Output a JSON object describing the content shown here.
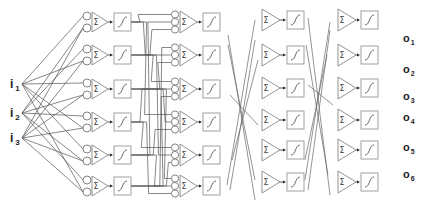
{
  "diagram": {
    "type": "feedforward-neural-network",
    "inputs": [
      {
        "label": "i",
        "sub": "1",
        "x": 10,
        "y": 88
      },
      {
        "label": "i",
        "sub": "2",
        "x": 10,
        "y": 117
      },
      {
        "label": "i",
        "sub": "3",
        "x": 10,
        "y": 142
      }
    ],
    "outputs": [
      {
        "label": "o",
        "sub": "1",
        "x": 403,
        "y": 42
      },
      {
        "label": "o",
        "sub": "2",
        "x": 403,
        "y": 73
      },
      {
        "label": "o",
        "sub": "3",
        "x": 403,
        "y": 100
      },
      {
        "label": "o",
        "sub": "4",
        "x": 403,
        "y": 121
      },
      {
        "label": "o",
        "sub": "5",
        "x": 403,
        "y": 151
      },
      {
        "label": "o",
        "sub": "6",
        "x": 403,
        "y": 178
      }
    ],
    "sum_symbol": "Σ",
    "layers": [
      {
        "name": "layer-1",
        "input_circles": 2,
        "circle_x": 87,
        "tri_x": 92,
        "tri_w": 16,
        "tri_h": 20,
        "box_x": 114,
        "box_w": 17,
        "box_h": 18,
        "rows": [
          22,
          55,
          89,
          122,
          155,
          186
        ]
      },
      {
        "name": "layer-2",
        "input_circles": 3,
        "circle_x": 175,
        "tri_x": 180,
        "tri_w": 17,
        "tri_h": 22,
        "box_x": 203,
        "box_w": 17,
        "box_h": 18,
        "rows": [
          22,
          55,
          89,
          122,
          155,
          186
        ]
      },
      {
        "name": "layer-3",
        "input_circles": 0,
        "circle_x": 0,
        "tri_x": 262,
        "tri_w": 18,
        "tri_h": 22,
        "box_x": 287,
        "box_w": 17,
        "box_h": 18,
        "rows": [
          20,
          55,
          88,
          120,
          150,
          182
        ]
      },
      {
        "name": "layer-4",
        "input_circles": 0,
        "circle_x": 0,
        "tri_x": 338,
        "tri_w": 18,
        "tri_h": 22,
        "box_x": 361,
        "box_w": 17,
        "box_h": 18,
        "rows": [
          20,
          55,
          88,
          120,
          150,
          182
        ]
      }
    ],
    "input_connections": [
      [
        0,
        0,
        0
      ],
      [
        0,
        1,
        1
      ],
      [
        0,
        2,
        0
      ],
      [
        0,
        3,
        1
      ],
      [
        0,
        4,
        0
      ],
      [
        0,
        5,
        1
      ],
      [
        1,
        0,
        1
      ],
      [
        1,
        1,
        0
      ],
      [
        1,
        2,
        1
      ],
      [
        1,
        3,
        0
      ],
      [
        1,
        4,
        1
      ],
      [
        1,
        5,
        0
      ],
      [
        2,
        1,
        1
      ],
      [
        2,
        2,
        1
      ],
      [
        2,
        3,
        1
      ],
      [
        2,
        4,
        1
      ],
      [
        2,
        5,
        1
      ],
      [
        2,
        0,
        1
      ]
    ],
    "l1_to_l2_connections": [
      [
        0,
        0,
        0
      ],
      [
        0,
        1,
        1
      ],
      [
        0,
        3,
        0
      ],
      [
        1,
        0,
        2
      ],
      [
        1,
        2,
        0
      ],
      [
        1,
        4,
        1
      ],
      [
        2,
        1,
        2
      ],
      [
        2,
        3,
        1
      ],
      [
        2,
        5,
        0
      ],
      [
        3,
        2,
        1
      ],
      [
        3,
        4,
        0
      ],
      [
        3,
        5,
        2
      ],
      [
        4,
        0,
        1
      ],
      [
        4,
        3,
        2
      ],
      [
        4,
        5,
        1
      ],
      [
        5,
        1,
        0
      ],
      [
        5,
        2,
        2
      ],
      [
        5,
        4,
        2
      ]
    ],
    "cross_lines_a": [
      [
        228,
        35,
        255,
        200
      ],
      [
        228,
        45,
        255,
        180
      ],
      [
        255,
        40,
        230,
        190
      ],
      [
        258,
        60,
        232,
        160
      ],
      [
        230,
        95,
        258,
        125
      ],
      [
        227,
        185,
        255,
        20
      ]
    ],
    "cross_lines_b": [
      [
        308,
        18,
        330,
        195
      ],
      [
        306,
        45,
        328,
        175
      ],
      [
        330,
        30,
        308,
        190
      ],
      [
        327,
        55,
        305,
        160
      ],
      [
        308,
        85,
        333,
        105
      ],
      [
        305,
        180,
        330,
        22
      ]
    ]
  }
}
